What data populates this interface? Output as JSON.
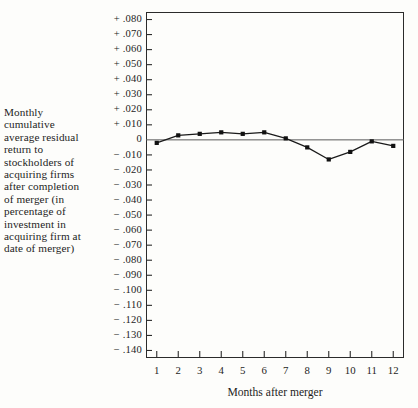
{
  "chart_data": {
    "type": "line",
    "title": "",
    "xlabel": "Months after merger",
    "ylabel": "Monthly cumulative average residual return to stockholders of acquiring firms after completion of merger (in percentage of investment in acquiring firm at date of merger)",
    "x": [
      1,
      2,
      3,
      4,
      5,
      6,
      7,
      8,
      9,
      10,
      11,
      12
    ],
    "values": [
      -0.002,
      0.003,
      0.004,
      0.005,
      0.004,
      0.005,
      0.001,
      -0.005,
      -0.013,
      -0.008,
      -0.001,
      -0.004
    ],
    "categories": [
      "1",
      "2",
      "3",
      "4",
      "5",
      "6",
      "7",
      "8",
      "9",
      "10",
      "11",
      "12"
    ],
    "xlim": [
      0.5,
      12.5
    ],
    "ylim": [
      -0.145,
      0.085
    ],
    "grid": false,
    "legend": null,
    "marker": "filled-square",
    "line_color": "#1a1a1a",
    "zero_line": 0,
    "y_ticks": [
      0.08,
      0.07,
      0.06,
      0.05,
      0.04,
      0.03,
      0.02,
      0.01,
      0,
      -0.01,
      -0.02,
      -0.03,
      -0.04,
      -0.05,
      -0.06,
      -0.07,
      -0.08,
      -0.09,
      -0.1,
      -0.11,
      -0.12,
      -0.13,
      -0.14
    ],
    "y_tick_labels": [
      "+ .080",
      "+ .070",
      "+ .060",
      "+ .050",
      "+ .040",
      "+ .030",
      "+ .020",
      "+ .010",
      "0",
      "− .010",
      "− .020",
      "− .030",
      "− .040",
      "− .050",
      "− .060",
      "− .070",
      "− .080",
      "− .090",
      "− .100",
      "− .110",
      "− .120",
      "− .130",
      "− .140"
    ]
  },
  "axes": {
    "y_caption": "Monthly cumulative average residual return to stockholders of acquiring firms after completion of merger (in percentage of investment in acquiring firm at date of merger)",
    "x_caption": "Months after merger"
  }
}
